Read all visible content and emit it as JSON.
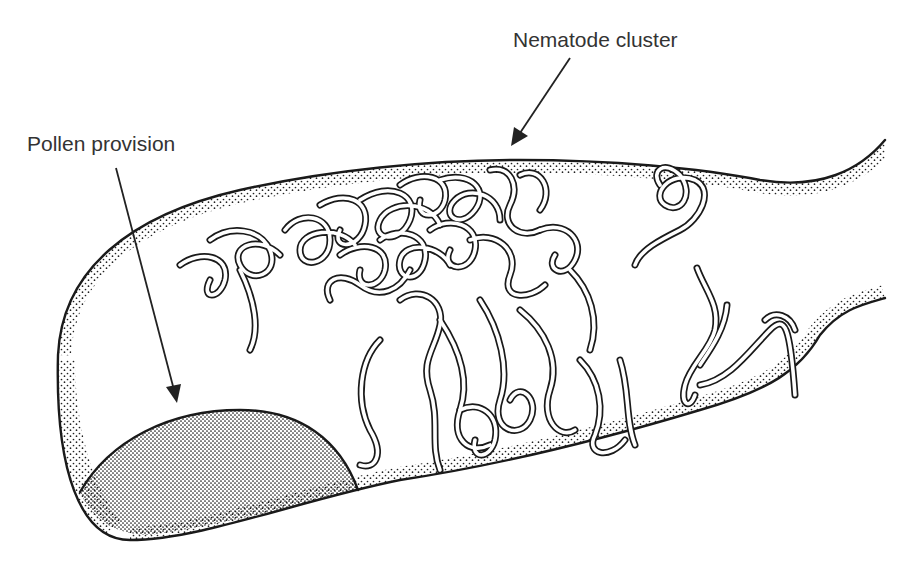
{
  "figure": {
    "type": "scientific-illustration",
    "background_color": "#ffffff",
    "ink_color": "#1a1a1a"
  },
  "labels": {
    "nematode_cluster": "Nematode cluster",
    "pollen_provision": "Pollen provision"
  },
  "annotations": [
    {
      "label": "Nematode cluster",
      "arrow_from": [
        570,
        58
      ],
      "arrow_to": [
        512,
        145
      ]
    },
    {
      "label": "Pollen provision",
      "arrow_from": [
        116,
        168
      ],
      "arrow_to": [
        177,
        402
      ]
    }
  ]
}
